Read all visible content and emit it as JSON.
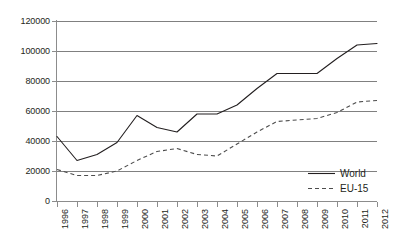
{
  "chart_data": {
    "type": "line",
    "title": "",
    "xlabel": "",
    "ylabel": "",
    "grid": true,
    "legend_position": "bottom-right",
    "ylim": [
      0,
      120000
    ],
    "xlim": [
      "1996",
      "2012"
    ],
    "y_ticks": [
      0,
      20000,
      40000,
      60000,
      80000,
      100000,
      120000
    ],
    "y_tick_labels": [
      "0",
      "20000",
      "40000",
      "60000",
      "80000",
      "100000",
      "120000"
    ],
    "categories": [
      "1996",
      "1997",
      "1998",
      "1999",
      "2000",
      "2001",
      "2002",
      "2003",
      "2004",
      "2005",
      "2006",
      "2007",
      "2008",
      "2009",
      "2010",
      "2011",
      "2012"
    ],
    "series": [
      {
        "name": "World",
        "style": "solid",
        "color": "#231f20",
        "values": [
          43000,
          27000,
          31000,
          39000,
          57000,
          49000,
          46000,
          58000,
          58000,
          64000,
          75000,
          85000,
          85000,
          85000,
          95000,
          104000,
          105000
        ]
      },
      {
        "name": "EU-15",
        "style": "dashed",
        "color": "#4d4d4d",
        "values": [
          21000,
          17000,
          17000,
          20000,
          27000,
          33000,
          35000,
          31000,
          30000,
          38000,
          46000,
          53000,
          54000,
          55000,
          59000,
          66000,
          67000
        ]
      }
    ]
  },
  "legend": {
    "items": [
      {
        "label": "World",
        "style": "solid"
      },
      {
        "label": "EU-15",
        "style": "dashed"
      }
    ]
  }
}
